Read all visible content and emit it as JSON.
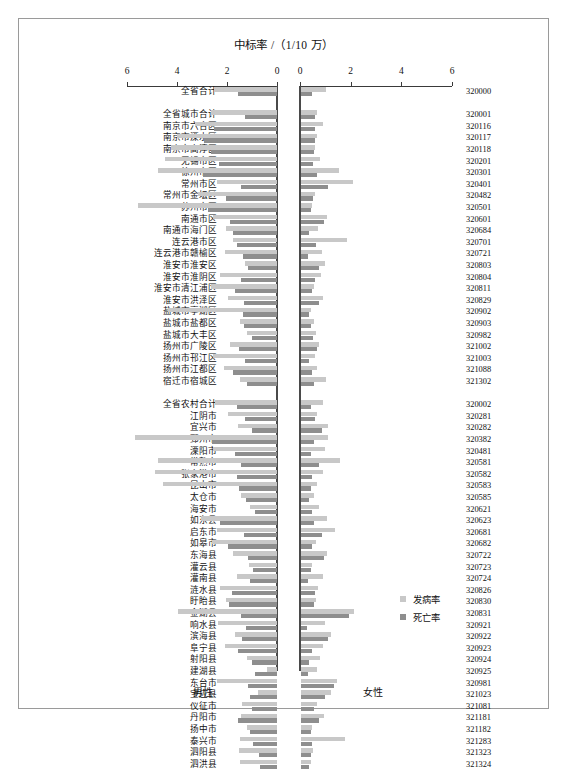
{
  "title": "中标率 /（1/10 万）",
  "axis": {
    "left_ticks": [
      "6",
      "4",
      "2",
      "0"
    ],
    "right_ticks": [
      "0",
      "2",
      "4",
      "6"
    ],
    "max": 6
  },
  "legend": {
    "incidence_label": "发病率",
    "mortality_label": "死亡率",
    "incidence_color": "#c8c8c8",
    "mortality_color": "#8e8e8e"
  },
  "footer": {
    "male": "男性",
    "female": "女性"
  },
  "chart_data": {
    "type": "bar",
    "title": "中标率 /（1/10 万）",
    "xlabel": "中标率 /（1/10 万）",
    "ylabel": "",
    "orientation": "horizontal-butterfly",
    "xlim": [
      0,
      6
    ],
    "grid": false,
    "legend_position": "bottom-right",
    "series": [
      {
        "name": "发病率",
        "side": "male",
        "color": "#c8c8c8"
      },
      {
        "name": "死亡率",
        "side": "male",
        "color": "#8e8e8e"
      },
      {
        "name": "发病率",
        "side": "female",
        "color": "#c8c8c8"
      },
      {
        "name": "死亡率",
        "side": "female",
        "color": "#8e8e8e"
      }
    ],
    "rows": [
      {
        "label": "全省合计",
        "code": "320000",
        "gap_after": true,
        "male_inc": 2.52,
        "male_mor": 1.55,
        "female_inc": 1.0,
        "female_mor": 0.42
      },
      {
        "label": "全省城市合计",
        "code": "320001",
        "male_inc": 2.65,
        "male_mor": 1.28,
        "female_inc": 0.62,
        "female_mor": 0.57
      },
      {
        "label": "南京市六合区",
        "code": "320116",
        "male_inc": 3.28,
        "male_mor": 2.52,
        "female_inc": 0.88,
        "female_mor": 0.55
      },
      {
        "label": "南京市溧水区",
        "code": "320117",
        "male_inc": 4.02,
        "male_mor": 2.91,
        "female_inc": 0.65,
        "female_mor": 0.55
      },
      {
        "label": "南京市高淳区",
        "code": "320118",
        "male_inc": 4.25,
        "male_mor": 2.65,
        "female_inc": 0.55,
        "female_mor": 0.5
      },
      {
        "label": "无锡市区",
        "code": "320201",
        "male_inc": 4.5,
        "male_mor": 2.32,
        "female_inc": 0.75,
        "female_mor": 0.48
      },
      {
        "label": "徐州市区",
        "code": "320301",
        "male_inc": 4.78,
        "male_mor": 2.95,
        "female_inc": 1.5,
        "female_mor": 0.62
      },
      {
        "label": "常州市区",
        "code": "320401",
        "male_inc": 2.42,
        "male_mor": 1.45,
        "female_inc": 2.05,
        "female_mor": 1.05
      },
      {
        "label": "常州市金坛区",
        "code": "320482",
        "male_inc": 3.15,
        "male_mor": 2.05,
        "female_inc": 0.55,
        "female_mor": 0.48
      },
      {
        "label": "苏州市区",
        "code": "320501",
        "male_inc": 5.58,
        "male_mor": 2.78,
        "female_inc": 0.42,
        "female_mor": 0.38
      },
      {
        "label": "南通市区",
        "code": "320601",
        "male_inc": 2.55,
        "male_mor": 1.88,
        "female_inc": 1.02,
        "female_mor": 0.92
      },
      {
        "label": "南通市海门区",
        "code": "320684",
        "male_inc": 2.05,
        "male_mor": 1.78,
        "female_inc": 0.68,
        "female_mor": 0.3
      },
      {
        "label": "连云港市区",
        "code": "320701",
        "male_inc": 1.78,
        "male_mor": 1.62,
        "female_inc": 1.82,
        "female_mor": 0.58
      },
      {
        "label": "连云港市赣榆区",
        "code": "320721",
        "male_inc": 2.08,
        "male_mor": 1.35,
        "female_inc": 0.82,
        "female_mor": 0.28
      },
      {
        "label": "淮安市淮安区",
        "code": "320803",
        "male_inc": 1.28,
        "male_mor": 1.18,
        "female_inc": 0.95,
        "female_mor": 0.72
      },
      {
        "label": "淮安市淮阴区",
        "code": "320804",
        "male_inc": 2.28,
        "male_mor": 1.45,
        "female_inc": 0.78,
        "female_mor": 0.55
      },
      {
        "label": "淮安市清江浦区",
        "code": "320811",
        "male_inc": 2.65,
        "male_mor": 1.68,
        "female_inc": 0.52,
        "female_mor": 0.42
      },
      {
        "label": "淮安市洪泽区",
        "code": "320829",
        "male_inc": 1.95,
        "male_mor": 1.32,
        "female_inc": 0.85,
        "female_mor": 0.7
      },
      {
        "label": "盐城市亭湖区",
        "code": "320902",
        "male_inc": 4.35,
        "male_mor": 1.38,
        "female_inc": 0.38,
        "female_mor": 0.3
      },
      {
        "label": "盐城市盐都区",
        "code": "320903",
        "male_inc": 1.48,
        "male_mor": 1.32,
        "female_inc": 0.52,
        "female_mor": 0.4
      },
      {
        "label": "盐城市大丰区",
        "code": "320982",
        "male_inc": 1.22,
        "male_mor": 1.0,
        "female_inc": 0.58,
        "female_mor": 0.48
      },
      {
        "label": "扬州市广陵区",
        "code": "321002",
        "male_inc": 1.9,
        "male_mor": 1.52,
        "female_inc": 0.72,
        "female_mor": 0.62
      },
      {
        "label": "扬州市邗江区",
        "code": "321003",
        "male_inc": 2.58,
        "male_mor": 1.28,
        "female_inc": 0.55,
        "female_mor": 0.32
      },
      {
        "label": "扬州市江都区",
        "code": "321088",
        "male_inc": 2.12,
        "male_mor": 1.75,
        "female_inc": 0.65,
        "female_mor": 0.42
      },
      {
        "label": "宿迁市宿城区",
        "code": "321302",
        "gap_after": true,
        "male_inc": 1.48,
        "male_mor": 1.22,
        "female_inc": 0.98,
        "female_mor": 0.52
      },
      {
        "label": "全省农村合计",
        "code": "320002",
        "male_inc": 2.48,
        "male_mor": 1.6,
        "female_inc": 0.85,
        "female_mor": 0.38
      },
      {
        "label": "江阴市",
        "code": "320281",
        "male_inc": 1.98,
        "male_mor": 1.28,
        "female_inc": 0.62,
        "female_mor": 0.55
      },
      {
        "label": "宜兴市",
        "code": "320282",
        "male_inc": 1.58,
        "male_mor": 1.02,
        "female_inc": 1.05,
        "female_mor": 0.82
      },
      {
        "label": "邳州市",
        "code": "320382",
        "male_inc": 5.7,
        "male_mor": 2.62,
        "female_inc": 1.08,
        "female_mor": 0.52
      },
      {
        "label": "溧阳市",
        "code": "320481",
        "male_inc": 2.55,
        "male_mor": 1.7,
        "female_inc": 0.95,
        "female_mor": 0.4
      },
      {
        "label": "常熟市",
        "code": "320581",
        "male_inc": 4.75,
        "male_mor": 1.45,
        "female_inc": 1.55,
        "female_mor": 0.72
      },
      {
        "label": "张家港市",
        "code": "320582",
        "male_inc": 4.88,
        "male_mor": 1.62,
        "female_inc": 0.85,
        "female_mor": 0.45
      },
      {
        "label": "昆山市",
        "code": "320583",
        "male_inc": 4.55,
        "male_mor": 1.52,
        "female_inc": 0.62,
        "female_mor": 0.38
      },
      {
        "label": "太仓市",
        "code": "320585",
        "male_inc": 1.45,
        "male_mor": 1.25,
        "female_inc": 0.52,
        "female_mor": 0.3
      },
      {
        "label": "海安市",
        "code": "320621",
        "male_inc": 1.08,
        "male_mor": 0.88,
        "female_inc": 0.72,
        "female_mor": 0.45
      },
      {
        "label": "如东县",
        "code": "320623",
        "male_inc": 3.05,
        "male_mor": 2.28,
        "female_inc": 1.02,
        "female_mor": 0.5
      },
      {
        "label": "启东市",
        "code": "320681",
        "male_inc": 2.42,
        "male_mor": 1.32,
        "female_inc": 1.35,
        "female_mor": 0.82
      },
      {
        "label": "如皋市",
        "code": "320682",
        "male_inc": 2.62,
        "male_mor": 1.95,
        "female_inc": 0.58,
        "female_mor": 0.42
      },
      {
        "label": "东海县",
        "code": "320722",
        "male_inc": 1.75,
        "male_mor": 1.18,
        "female_inc": 1.02,
        "female_mor": 0.9
      },
      {
        "label": "灌云县",
        "code": "320723",
        "male_inc": 1.12,
        "male_mor": 0.95,
        "female_inc": 0.45,
        "female_mor": 0.38
      },
      {
        "label": "灌南县",
        "code": "320724",
        "male_inc": 1.6,
        "male_mor": 1.08,
        "female_inc": 0.88,
        "female_mor": 0.28
      },
      {
        "label": "涟水县",
        "code": "320826",
        "male_inc": 2.28,
        "male_mor": 1.82,
        "female_inc": 0.68,
        "female_mor": 0.55
      },
      {
        "label": "盱眙县",
        "code": "320830",
        "male_inc": 2.05,
        "male_mor": 1.92,
        "female_inc": 0.58,
        "female_mor": 0.5
      },
      {
        "label": "金湖县",
        "code": "320831",
        "male_inc": 3.98,
        "male_mor": 1.45,
        "female_inc": 2.1,
        "female_mor": 1.88
      },
      {
        "label": "响水县",
        "code": "320921",
        "male_inc": 2.35,
        "male_mor": 1.25,
        "female_inc": 0.95,
        "female_mor": 0.25
      },
      {
        "label": "滨海县",
        "code": "320922",
        "male_inc": 1.68,
        "male_mor": 1.42,
        "female_inc": 1.2,
        "female_mor": 1.05
      },
      {
        "label": "阜宁县",
        "code": "320923",
        "male_inc": 2.1,
        "male_mor": 1.55,
        "female_inc": 0.88,
        "female_mor": 0.42
      },
      {
        "label": "射阳县",
        "code": "320924",
        "male_inc": 1.2,
        "male_mor": 1.02,
        "female_inc": 0.75,
        "female_mor": 0.3
      },
      {
        "label": "建湖县",
        "code": "320925",
        "male_inc": 0.42,
        "male_mor": 0.88,
        "female_inc": 0.62,
        "female_mor": 0.28
      },
      {
        "label": "东台市",
        "code": "320981",
        "male_inc": 2.42,
        "male_mor": 1.18,
        "female_inc": 1.42,
        "female_mor": 1.3
      },
      {
        "label": "宝应县",
        "code": "321023",
        "male_inc": 0.75,
        "male_mor": 1.08,
        "female_inc": 1.18,
        "female_mor": 0.95
      },
      {
        "label": "仪征市",
        "code": "321081",
        "male_inc": 1.42,
        "male_mor": 1.02,
        "female_inc": 0.62,
        "female_mor": 0.52
      },
      {
        "label": "丹阳市",
        "code": "321181",
        "male_inc": 1.45,
        "male_mor": 1.58,
        "female_inc": 0.92,
        "female_mor": 0.72
      },
      {
        "label": "扬中市",
        "code": "321182",
        "male_inc": 1.22,
        "male_mor": 1.1,
        "female_inc": 0.45,
        "female_mor": 0.38
      },
      {
        "label": "泰兴市",
        "code": "321283",
        "male_inc": 1.48,
        "male_mor": 0.95,
        "female_inc": 1.75,
        "female_mor": 0.45
      },
      {
        "label": "泗阳县",
        "code": "321323",
        "male_inc": 1.52,
        "male_mor": 0.72,
        "female_inc": 0.48,
        "female_mor": 0.4
      },
      {
        "label": "泗洪县",
        "code": "321324",
        "male_inc": 1.48,
        "male_mor": 0.68,
        "female_inc": 0.38,
        "female_mor": 0.32
      }
    ]
  }
}
